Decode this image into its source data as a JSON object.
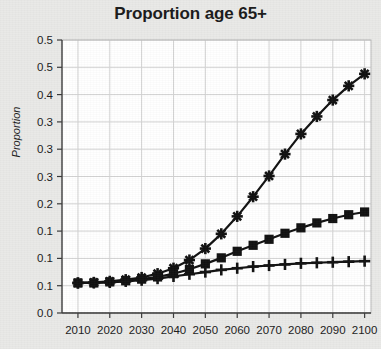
{
  "chart_data": {
    "type": "line",
    "title": "Proportion age 65+",
    "xlabel": "",
    "ylabel": "Proportion",
    "grid": true,
    "legend": "none",
    "xlim": [
      2005,
      2102
    ],
    "ylim": [
      0.0,
      0.5
    ],
    "y_tick_values": [
      0.0,
      0.05,
      0.1,
      0.15,
      0.2,
      0.25,
      0.3,
      0.35,
      0.4,
      0.45,
      0.5
    ],
    "y_tick_labels": [
      "0.0",
      "0.1",
      "0.1",
      "0.2",
      "0.2",
      "0.3",
      "0.3",
      "0.4",
      "0.4",
      "0.5"
    ],
    "y_tick_labels_values": [
      0.0,
      0.05,
      0.1,
      0.15,
      0.2,
      0.25,
      0.3,
      0.35,
      0.4,
      0.45,
      0.5
    ],
    "x_tick_labels": [
      "2010",
      "2020",
      "2030",
      "2040",
      "2050",
      "2060",
      "2070",
      "2080",
      "2090",
      "2100"
    ],
    "x_tick_values": [
      2010,
      2020,
      2030,
      2040,
      2050,
      2060,
      2070,
      2080,
      2090,
      2100
    ],
    "x": [
      2010,
      2015,
      2020,
      2025,
      2030,
      2035,
      2040,
      2045,
      2050,
      2055,
      2060,
      2065,
      2070,
      2075,
      2080,
      2085,
      2090,
      2095,
      2100
    ],
    "series": [
      {
        "name": "high-growth-series",
        "marker": "asterisk",
        "color": "#111111",
        "values": [
          0.055,
          0.056,
          0.058,
          0.061,
          0.065,
          0.072,
          0.082,
          0.097,
          0.118,
          0.145,
          0.177,
          0.213,
          0.251,
          0.291,
          0.328,
          0.36,
          0.39,
          0.416,
          0.438
        ]
      },
      {
        "name": "mid-growth-series",
        "marker": "square",
        "color": "#111111",
        "values": [
          0.055,
          0.055,
          0.057,
          0.059,
          0.062,
          0.066,
          0.072,
          0.08,
          0.09,
          0.101,
          0.113,
          0.124,
          0.135,
          0.146,
          0.156,
          0.165,
          0.173,
          0.18,
          0.185
        ]
      },
      {
        "name": "low-growth-series",
        "marker": "plus",
        "color": "#111111",
        "values": [
          0.055,
          0.055,
          0.056,
          0.058,
          0.06,
          0.063,
          0.067,
          0.071,
          0.075,
          0.079,
          0.082,
          0.085,
          0.087,
          0.089,
          0.091,
          0.092,
          0.093,
          0.094,
          0.095
        ]
      }
    ]
  }
}
